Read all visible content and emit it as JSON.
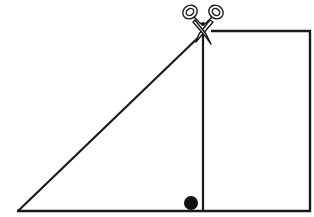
{
  "diagram": {
    "shapes": {
      "triangle": {
        "vertices": [
          [
            18,
            211
          ],
          [
            203,
            30
          ],
          [
            203,
            211
          ]
        ],
        "label": "triangle"
      },
      "rectangle": {
        "top_left": [
          203,
          31
        ],
        "bottom_right": [
          310,
          211
        ],
        "label": "rectangle"
      },
      "cut_line": {
        "from": [
          203,
          30
        ],
        "to": [
          203,
          211
        ],
        "label": "cut line"
      },
      "right_angle_marker": {
        "center": [
          191,
          203
        ],
        "radius": 6.5,
        "label": "right angle dot"
      },
      "scissors": {
        "center": [
          203,
          24
        ],
        "label": "scissors"
      }
    },
    "colors": {
      "stroke": "#1a1a1a",
      "fill_dot": "#111111",
      "background": "#ffffff"
    }
  }
}
